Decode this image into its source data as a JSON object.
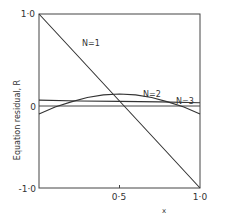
{
  "chart_data": {
    "type": "line",
    "title": "",
    "xlabel": "x",
    "ylabel": "Equation residual, R",
    "xlim": [
      0,
      1.0
    ],
    "ylim": [
      -1.0,
      1.0
    ],
    "grid": false,
    "legend": "inline labels",
    "x_ticks": [
      "0·5",
      "1·0"
    ],
    "y_ticks": [
      "1·0",
      "0",
      "-1·0"
    ],
    "series": [
      {
        "name": "N=1",
        "x": [
          0,
          0.25,
          0.5,
          0.75,
          1.0
        ],
        "values": [
          1.0,
          0.5,
          0.0,
          -0.5,
          -1.0
        ]
      },
      {
        "name": "N=2",
        "x": [
          0,
          0.1,
          0.2,
          0.3,
          0.4,
          0.5,
          0.6,
          0.7,
          0.8,
          0.9,
          1.0
        ],
        "values": [
          -0.15,
          -0.07,
          -0.01,
          0.04,
          0.07,
          0.08,
          0.07,
          0.04,
          -0.01,
          -0.07,
          -0.15
        ]
      },
      {
        "name": "N=3",
        "x": [
          0,
          0.25,
          0.5,
          0.75,
          1.0
        ],
        "values": [
          0.01,
          0.0,
          -0.005,
          -0.01,
          -0.02
        ]
      }
    ],
    "annotations": [
      "N=1",
      "N=2",
      "N=3"
    ]
  },
  "labels": {
    "y_top": "1·0",
    "y_zero": "0",
    "y_bottom": "-1·0",
    "x_mid": "0·5",
    "x_right": "1·0",
    "x_axis": "x",
    "y_axis": "Equation residual, R",
    "n1": "N=1",
    "n2": "N=2",
    "n3": "N=3"
  }
}
